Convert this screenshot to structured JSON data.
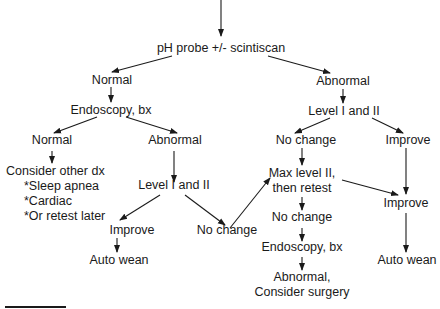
{
  "diagram": {
    "type": "flowchart",
    "nodes": {
      "start": "pH probe +/- scintiscan",
      "normal_1": "Normal",
      "abnormal_1": "Abnormal",
      "endoscopy_1": "Endoscopy, bx",
      "normal_2": "Normal",
      "abnormal_2": "Abnormal",
      "consider_other": "Consider other dx",
      "sleep_apnea": "*Sleep apnea",
      "cardiac": "*Cardiac",
      "retest_later": "*Or retest later",
      "level_left": "Level I and II",
      "improve_left": "Improve",
      "auto_wean_left": "Auto wean",
      "no_change_left": "No change",
      "level_right": "Level I and II",
      "no_change_right": "No change",
      "improve_right_top": "Improve",
      "max_level_1": "Max level II,",
      "max_level_2": "then retest",
      "improve_right": "Improve",
      "no_change_right_2": "No change",
      "endoscopy_2": "Endoscopy, bx",
      "abnormal_final_1": "Abnormal,",
      "abnormal_final_2": "Consider surgery",
      "auto_wean_right": "Auto wean"
    },
    "edges": [
      [
        "entry",
        "start"
      ],
      [
        "start",
        "normal_1"
      ],
      [
        "start",
        "abnormal_1"
      ],
      [
        "normal_1",
        "endoscopy_1"
      ],
      [
        "endoscopy_1",
        "normal_2"
      ],
      [
        "endoscopy_1",
        "abnormal_2"
      ],
      [
        "normal_2",
        "consider_other"
      ],
      [
        "abnormal_2",
        "level_left"
      ],
      [
        "level_left",
        "improve_left"
      ],
      [
        "level_left",
        "no_change_left"
      ],
      [
        "improve_left",
        "auto_wean_left"
      ],
      [
        "no_change_left",
        "max_level"
      ],
      [
        "abnormal_1",
        "level_right"
      ],
      [
        "level_right",
        "no_change_right"
      ],
      [
        "level_right",
        "improve_right_top"
      ],
      [
        "no_change_right",
        "max_level"
      ],
      [
        "max_level",
        "improve_right"
      ],
      [
        "improve_right_top",
        "improve_right"
      ],
      [
        "max_level",
        "no_change_right_2"
      ],
      [
        "no_change_right_2",
        "endoscopy_2"
      ],
      [
        "endoscopy_2",
        "abnormal_final"
      ],
      [
        "improve_right",
        "auto_wean_right"
      ]
    ]
  }
}
